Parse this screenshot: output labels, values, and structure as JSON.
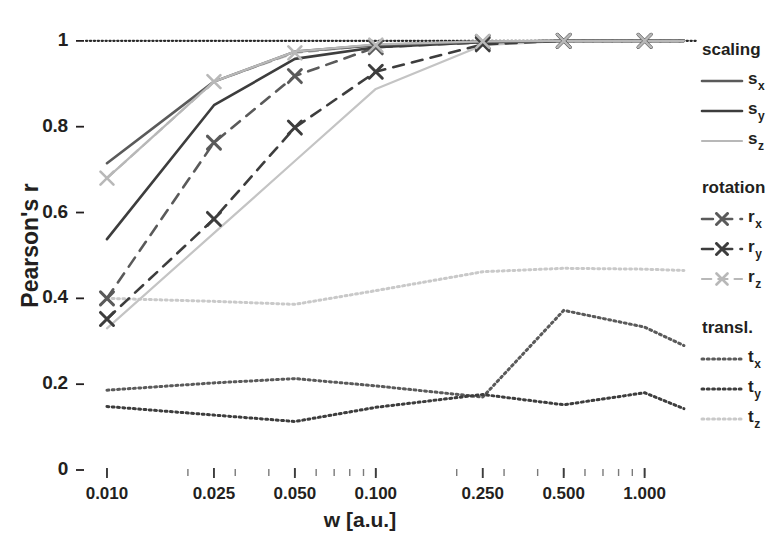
{
  "title_partial": "",
  "axes": {
    "ylabel": "Pearson's r",
    "xlabel": "w [a.u.]",
    "yticks": [
      "0",
      "0.2",
      "0.4",
      "0.6",
      "0.8",
      "1"
    ],
    "ytick_values": [
      0,
      0.2,
      0.4,
      0.6,
      0.8,
      1
    ],
    "xticks": [
      "0.010",
      "0.025",
      "0.050",
      "0.100",
      "0.250",
      "0.500",
      "1.000"
    ],
    "xtick_values": [
      0.01,
      0.025,
      0.05,
      0.1,
      0.25,
      0.5,
      1.0
    ]
  },
  "legend": {
    "groups": [
      {
        "name": "scaling-group",
        "title": "scaling",
        "entries": [
          {
            "name": "legend-item-sx",
            "base": "s",
            "sub": "x",
            "style": "solid",
            "marker": "none",
            "color": "#5a5a5a",
            "width": 2.6
          },
          {
            "name": "legend-item-sy",
            "base": "s",
            "sub": "y",
            "style": "solid",
            "marker": "none",
            "color": "#3d3d3d",
            "width": 2.6
          },
          {
            "name": "legend-item-sz",
            "base": "s",
            "sub": "z",
            "style": "solid",
            "marker": "none",
            "color": "#b8b8b8",
            "width": 2.2
          }
        ]
      },
      {
        "name": "rotation-group",
        "title": "rotation",
        "entries": [
          {
            "name": "legend-item-rx",
            "base": "r",
            "sub": "x",
            "style": "dashed",
            "marker": "x",
            "color": "#5a5a5a",
            "width": 2.6
          },
          {
            "name": "legend-item-ry",
            "base": "r",
            "sub": "y",
            "style": "dashed",
            "marker": "x",
            "color": "#3d3d3d",
            "width": 2.6
          },
          {
            "name": "legend-item-rz",
            "base": "r",
            "sub": "z",
            "style": "dashed",
            "marker": "x",
            "color": "#b8b8b8",
            "width": 2.2
          }
        ]
      },
      {
        "name": "translation-group",
        "title": "transl.",
        "entries": [
          {
            "name": "legend-item-tx",
            "base": "t",
            "sub": "x",
            "style": "dotted",
            "marker": "none",
            "color": "#5a5a5a",
            "width": 3.0
          },
          {
            "name": "legend-item-ty",
            "base": "t",
            "sub": "y",
            "style": "dotted",
            "marker": "none",
            "color": "#3d3d3d",
            "width": 3.0
          },
          {
            "name": "legend-item-tz",
            "base": "t",
            "sub": "z",
            "style": "dotted",
            "marker": "none",
            "color": "#c9c9c9",
            "width": 3.0
          }
        ]
      }
    ]
  },
  "chart_data": {
    "type": "line",
    "title": "",
    "xlabel": "w [a.u.]",
    "ylabel": "Pearson's r",
    "xscale": "log",
    "xlim": [
      0.0085,
      1.45
    ],
    "ylim": [
      0,
      1.03
    ],
    "grid": false,
    "reference_line": {
      "y": 1.0,
      "style": "dotted",
      "color": "#2b2b2b"
    },
    "x": [
      0.01,
      0.025,
      0.05,
      0.1,
      0.25,
      0.5,
      1.0,
      1.4
    ],
    "series": [
      {
        "name": "s_x",
        "label": "s_x",
        "group": "scaling",
        "style": "solid",
        "marker": "none",
        "color": "#5a5a5a",
        "width": 2.6,
        "values": [
          0.715,
          0.905,
          0.975,
          0.99,
          0.998,
          1.0,
          1.0,
          1.0
        ]
      },
      {
        "name": "s_y",
        "label": "s_y",
        "group": "scaling",
        "style": "solid",
        "marker": "none",
        "color": "#3d3d3d",
        "width": 2.6,
        "values": [
          0.538,
          0.85,
          0.958,
          0.985,
          0.997,
          1.0,
          1.0,
          1.0
        ]
      },
      {
        "name": "s_z",
        "label": "s_z",
        "group": "scaling",
        "style": "solid",
        "marker": "none",
        "color": "#b8b8b8",
        "width": 2.2,
        "values": [
          0.68,
          0.905,
          0.975,
          0.992,
          0.999,
          1.0,
          1.0,
          1.0
        ]
      },
      {
        "name": "r_x",
        "label": "r_x",
        "group": "rotation",
        "style": "dashed",
        "marker": "x",
        "color": "#5a5a5a",
        "width": 2.6,
        "values": [
          0.4,
          0.763,
          0.918,
          0.985,
          0.997,
          1.0,
          1.0,
          1.0
        ]
      },
      {
        "name": "r_y",
        "label": "r_y",
        "group": "rotation",
        "style": "dashed",
        "marker": "x",
        "color": "#3d3d3d",
        "width": 2.6,
        "values": [
          0.352,
          0.585,
          0.798,
          0.928,
          0.992,
          1.0,
          1.0,
          1.0
        ]
      },
      {
        "name": "r_z",
        "label": "r_z",
        "group": "rotation",
        "style": "dashed",
        "marker": "x",
        "color": "#b8b8b8",
        "width": 2.2,
        "values": [
          0.68,
          0.905,
          0.972,
          0.99,
          0.999,
          1.0,
          1.0,
          1.0
        ]
      },
      {
        "name": "s_y_light",
        "label": "scaling-light",
        "group": "scaling",
        "style": "solid",
        "marker": "none",
        "color": "#c4c4c4",
        "width": 2.2,
        "values": [
          0.33,
          0.552,
          0.72,
          0.888,
          0.99,
          1.0,
          1.0,
          1.0
        ]
      },
      {
        "name": "t_x",
        "label": "t_x",
        "group": "translation",
        "style": "dotted",
        "marker": "none",
        "color": "#5a5a5a",
        "width": 3.0,
        "values": [
          0.186,
          0.203,
          0.213,
          0.196,
          0.17,
          0.372,
          0.333,
          0.29
        ]
      },
      {
        "name": "t_y",
        "label": "t_y",
        "group": "translation",
        "style": "dotted",
        "marker": "none",
        "color": "#3d3d3d",
        "width": 3.0,
        "values": [
          0.148,
          0.128,
          0.113,
          0.146,
          0.176,
          0.152,
          0.18,
          0.143
        ]
      },
      {
        "name": "t_z",
        "label": "t_z",
        "group": "translation",
        "style": "dotted",
        "marker": "none",
        "color": "#c9c9c9",
        "width": 3.0,
        "values": [
          0.4,
          0.393,
          0.386,
          0.418,
          0.462,
          0.47,
          0.468,
          0.465
        ]
      }
    ],
    "markers": {
      "r_x": [
        {
          "x": 0.01,
          "y": 0.4
        },
        {
          "x": 0.025,
          "y": 0.763
        },
        {
          "x": 0.05,
          "y": 0.918
        },
        {
          "x": 0.1,
          "y": 0.985
        },
        {
          "x": 0.25,
          "y": 0.997
        },
        {
          "x": 0.5,
          "y": 1.0
        },
        {
          "x": 1.0,
          "y": 1.0
        }
      ],
      "r_y": [
        {
          "x": 0.01,
          "y": 0.352
        },
        {
          "x": 0.025,
          "y": 0.585
        },
        {
          "x": 0.05,
          "y": 0.798
        },
        {
          "x": 0.1,
          "y": 0.928
        },
        {
          "x": 0.25,
          "y": 0.992
        },
        {
          "x": 0.5,
          "y": 1.0
        },
        {
          "x": 1.0,
          "y": 1.0
        }
      ],
      "r_z": [
        {
          "x": 0.01,
          "y": 0.68
        },
        {
          "x": 0.025,
          "y": 0.905
        },
        {
          "x": 0.05,
          "y": 0.972
        },
        {
          "x": 0.1,
          "y": 0.99
        },
        {
          "x": 0.25,
          "y": 0.999
        },
        {
          "x": 0.5,
          "y": 1.0
        },
        {
          "x": 1.0,
          "y": 1.0
        }
      ]
    }
  }
}
